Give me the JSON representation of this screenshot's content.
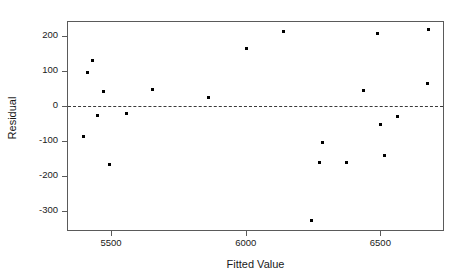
{
  "chart_data": {
    "type": "scatter",
    "title": "",
    "xlabel": "Fitted Value",
    "ylabel": "Residual",
    "xlim": [
      5340,
      6740
    ],
    "ylim": [
      -360,
      240
    ],
    "xticks": [
      "5500",
      "6000",
      "6500"
    ],
    "xtick_values": [
      5500,
      6000,
      6500
    ],
    "yticks": [
      "200",
      "100",
      "0",
      "-100",
      "-200",
      "-300"
    ],
    "ytick_values": [
      200,
      100,
      0,
      -100,
      -200,
      -300
    ],
    "grid": false,
    "legend": null,
    "reference_line": {
      "orientation": "horizontal",
      "value": 0,
      "style": "dashed"
    },
    "marker": {
      "shape": "square",
      "size_px": 3,
      "color": "#000000"
    },
    "points": [
      {
        "x": 5412,
        "y": 96
      },
      {
        "x": 5431,
        "y": 130
      },
      {
        "x": 5398,
        "y": -88
      },
      {
        "x": 5451,
        "y": -28
      },
      {
        "x": 5470,
        "y": 42
      },
      {
        "x": 5493,
        "y": -167
      },
      {
        "x": 5557,
        "y": -20
      },
      {
        "x": 5655,
        "y": 47
      },
      {
        "x": 5860,
        "y": 24
      },
      {
        "x": 6004,
        "y": 165
      },
      {
        "x": 6140,
        "y": 213
      },
      {
        "x": 6243,
        "y": -328
      },
      {
        "x": 6284,
        "y": -104
      },
      {
        "x": 6273,
        "y": -162
      },
      {
        "x": 6375,
        "y": -162
      },
      {
        "x": 6436,
        "y": 43
      },
      {
        "x": 6489,
        "y": 207
      },
      {
        "x": 6500,
        "y": -53
      },
      {
        "x": 6515,
        "y": -141
      },
      {
        "x": 6564,
        "y": -31
      },
      {
        "x": 6678,
        "y": 218
      },
      {
        "x": 6674,
        "y": 64
      }
    ]
  },
  "colors": {
    "axis": "#5a5a5a",
    "point": "#000000",
    "reference_line": "#3a3a3a",
    "text": "#1a1a1a",
    "background": "#ffffff"
  }
}
